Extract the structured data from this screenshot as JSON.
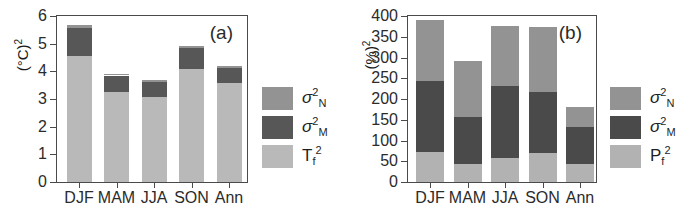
{
  "figure": {
    "panels": [
      {
        "tag": "(a)",
        "ylabel": "(°C)",
        "ylabel_exp": "2",
        "ylim": [
          0,
          6
        ],
        "yticks": [
          0,
          1,
          2,
          3,
          4,
          5,
          6
        ],
        "categories": [
          "DJF",
          "MAM",
          "JJA",
          "SON",
          "Ann"
        ],
        "legend": [
          {
            "symbol": "σ",
            "sup": "2",
            "sub": "N",
            "color": "#939393"
          },
          {
            "symbol": "σ",
            "sup": "2",
            "sub": "M",
            "color": "#575757"
          },
          {
            "symbol": "T",
            "sup": "2",
            "sub": "f",
            "color": "#b9b9b9"
          }
        ]
      },
      {
        "tag": "(b)",
        "ylabel": "(%)",
        "ylabel_exp": "2",
        "ylim": [
          0,
          400
        ],
        "yticks": [
          0,
          50,
          100,
          150,
          200,
          250,
          300,
          350,
          400
        ],
        "categories": [
          "DJF",
          "MAM",
          "JJA",
          "SON",
          "Ann"
        ],
        "legend": [
          {
            "symbol": "σ",
            "sup": "2",
            "sub": "N",
            "color": "#939393"
          },
          {
            "symbol": "σ",
            "sup": "2",
            "sub": "M",
            "color": "#4a4a4a"
          },
          {
            "symbol": "P",
            "sup": "2",
            "sub": "f",
            "color": "#b2b2b2"
          }
        ]
      }
    ]
  },
  "chart_data": [
    {
      "type": "bar",
      "stacked": true,
      "panel": "(a)",
      "title": "",
      "xlabel": "",
      "ylabel": "(°C)2",
      "ylim": [
        0,
        6
      ],
      "yticks": [
        0,
        1,
        2,
        3,
        4,
        5,
        6
      ],
      "grid": false,
      "legend_position": "right-outside",
      "categories": [
        "DJF",
        "MAM",
        "JJA",
        "SON",
        "Ann"
      ],
      "series": [
        {
          "name": "Tf2",
          "color": "#b9b9b9",
          "values": [
            4.55,
            3.25,
            3.07,
            4.07,
            3.58
          ]
        },
        {
          "name": "sigma2_M",
          "color": "#575757",
          "values": [
            1.02,
            0.6,
            0.56,
            0.76,
            0.53
          ]
        },
        {
          "name": "sigma2_N",
          "color": "#939393",
          "values": [
            0.1,
            0.07,
            0.07,
            0.07,
            0.07
          ]
        }
      ],
      "totals": [
        5.67,
        3.92,
        3.7,
        4.9,
        4.18
      ]
    },
    {
      "type": "bar",
      "stacked": true,
      "panel": "(b)",
      "title": "",
      "xlabel": "",
      "ylabel": "(%)2",
      "ylim": [
        0,
        400
      ],
      "yticks": [
        0,
        50,
        100,
        150,
        200,
        250,
        300,
        350,
        400
      ],
      "grid": false,
      "legend_position": "right-outside",
      "categories": [
        "DJF",
        "MAM",
        "JJA",
        "SON",
        "Ann"
      ],
      "series": [
        {
          "name": "Pf2",
          "color": "#b2b2b2",
          "values": [
            73,
            44,
            59,
            69,
            43
          ]
        },
        {
          "name": "sigma2_M",
          "color": "#4a4a4a",
          "values": [
            170,
            113,
            172,
            148,
            90
          ]
        },
        {
          "name": "sigma2_N",
          "color": "#939393",
          "values": [
            147,
            134,
            144,
            156,
            47
          ]
        }
      ],
      "totals": [
        390,
        291,
        375,
        373,
        180
      ]
    }
  ]
}
